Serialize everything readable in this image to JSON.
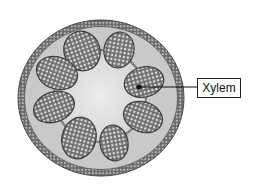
{
  "diagram": {
    "type": "plant stem cross-section",
    "labels": [
      {
        "text": "Xylem",
        "target": "vascular-bundle-right-upper"
      }
    ],
    "vascular_bundle_count": 8,
    "colors": {
      "epidermis_fill": "#9a9a9a",
      "epidermis_cells": "#6a6a6a",
      "cortex": "#c8c8c8",
      "pith": "#e2e2e2",
      "bundle_fill": "#7e7e7e",
      "bundle_cells": "#d8d8d8",
      "outline": "#3c3c3c",
      "label_border": "#222222"
    }
  }
}
